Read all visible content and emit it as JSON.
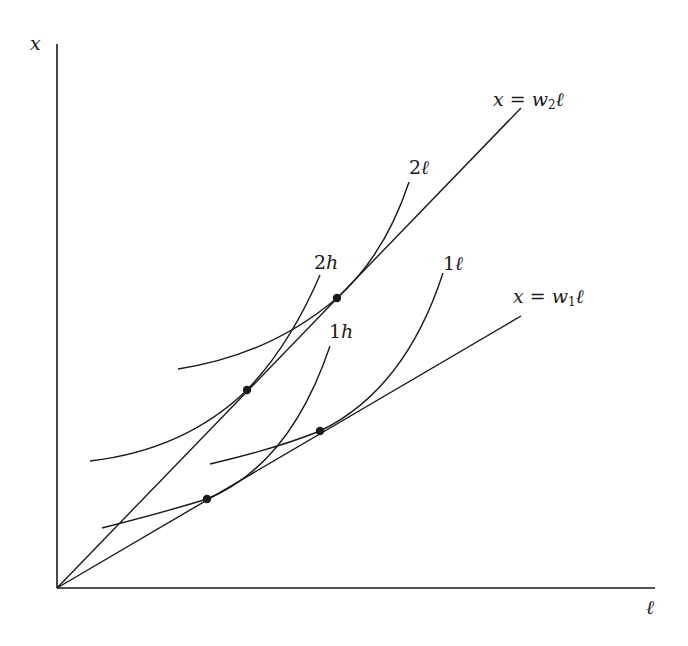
{
  "diagram": {
    "axes": {
      "y_label": "x",
      "x_label": "ℓ",
      "origin": [
        57,
        588
      ],
      "x_end": [
        655,
        588
      ],
      "y_end": [
        57,
        44
      ]
    },
    "rays": [
      {
        "id": "w2",
        "label_lhs": "x = w",
        "label_sub": "2",
        "label_rhs": "ℓ",
        "from": [
          57,
          588
        ],
        "to": [
          521,
          108
        ]
      },
      {
        "id": "w1",
        "label_lhs": "x = w",
        "label_sub": "1",
        "label_rhs": "ℓ",
        "from": [
          57,
          588
        ],
        "to": [
          521,
          316
        ]
      }
    ],
    "curves": [
      {
        "id": "1h",
        "label_num": "1",
        "label_var": "h",
        "path": "M102,528 Q165,512 207,499 Q290,465 330,346"
      },
      {
        "id": "1l",
        "label_num": "1",
        "label_var": "ℓ",
        "path": "M210,464 Q275,449 320,431 Q405,390 443,273"
      },
      {
        "id": "2h",
        "label_num": "2",
        "label_var": "h",
        "path": "M90,461 Q185,450 247,390 Q290,345 320,275"
      },
      {
        "id": "2l",
        "label_num": "2",
        "label_var": "ℓ",
        "path": "M178,369 Q270,355 337,298 Q385,255 409,182"
      }
    ],
    "tangency_points": [
      {
        "curve": "1h",
        "ray": "w1",
        "at": [
          207,
          499
        ]
      },
      {
        "curve": "1l",
        "ray": "w1",
        "at": [
          320,
          431
        ]
      },
      {
        "curve": "2h",
        "ray": "w2",
        "at": [
          247,
          390
        ]
      },
      {
        "curve": "2l",
        "ray": "w2",
        "at": [
          337,
          298
        ]
      }
    ],
    "colors": {
      "ink": "#1a1a1a",
      "background": "#ffffff"
    }
  }
}
